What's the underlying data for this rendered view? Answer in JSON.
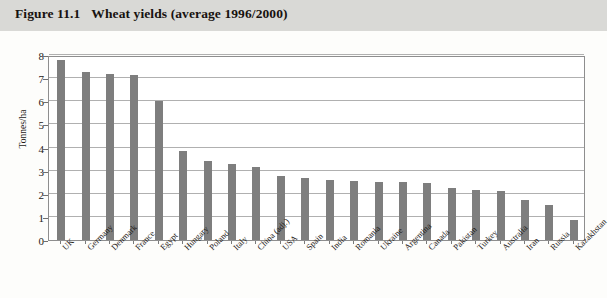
{
  "figure": {
    "number": "Figure 11.1",
    "caption": "Wheat yields (average 1996/2000)"
  },
  "chart_data": {
    "type": "bar",
    "title": "Wheat yields (average 1996/2000)",
    "xlabel": "",
    "ylabel": "Tonnes/ha",
    "ylim": [
      0,
      8
    ],
    "yticks": [
      "0",
      "1",
      "2",
      "3",
      "4",
      "5",
      "6",
      "7",
      "8"
    ],
    "grid": true,
    "legend": "none",
    "bar_color": "#7e7e7e",
    "categories": [
      "UK",
      "Germany",
      "Denmark",
      "France",
      "Egypt",
      "Hungary",
      "Poland",
      "Italy",
      "China (adj.)",
      "USA",
      "Spain",
      "India",
      "Romania",
      "Ukraine",
      "Argentina",
      "Canada",
      "Pakistan",
      "Turkey",
      "Australia",
      "Iran",
      "Russia",
      "Kazakhstan"
    ],
    "values": [
      7.8,
      7.25,
      7.2,
      7.15,
      6.0,
      3.85,
      3.4,
      3.3,
      3.15,
      2.75,
      2.7,
      2.6,
      2.55,
      2.5,
      2.5,
      2.45,
      2.25,
      2.15,
      2.1,
      1.75,
      1.5,
      0.85
    ]
  },
  "colors": {
    "title_band": "#d9d9d6",
    "bar": "#7e7e7e",
    "grid": "#b0b0b0",
    "frame": "#8e8e8e",
    "text": "#1d1a17"
  }
}
